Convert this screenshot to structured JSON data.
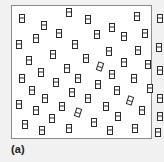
{
  "figure": {
    "panel_label": "(a)",
    "colors": {
      "outer_background": "#f1f1f1",
      "box_background": "#ffffff",
      "box_border": "#8a8a8a",
      "particle_outline": "#2b2b2b",
      "label_text": "#1a1a1a"
    },
    "container": {
      "x": 11,
      "y": 5,
      "width": 141,
      "height": 134
    },
    "particle": {
      "shape_name": "diatomic-molecule-icon",
      "width": 6,
      "height": 9,
      "description": "vertical rectangle divided by a horizontal line into two stacked units"
    },
    "particle_count": 56,
    "particles": [
      {
        "x": 10,
        "y": 12,
        "rot": 0
      },
      {
        "x": 57,
        "y": 6,
        "rot": 0
      },
      {
        "x": 32,
        "y": 19,
        "rot": 0
      },
      {
        "x": 76,
        "y": 13,
        "rot": 0
      },
      {
        "x": 100,
        "y": 21,
        "rot": 0
      },
      {
        "x": 125,
        "y": 10,
        "rot": 0
      },
      {
        "x": 148,
        "y": 12,
        "rot": 0
      },
      {
        "x": 47,
        "y": 27,
        "rot": 0
      },
      {
        "x": 85,
        "y": 28,
        "rot": 0
      },
      {
        "x": 112,
        "y": 30,
        "rot": 0
      },
      {
        "x": 133,
        "y": 27,
        "rot": 0
      },
      {
        "x": 7,
        "y": 38,
        "rot": 0
      },
      {
        "x": 24,
        "y": 32,
        "rot": 0
      },
      {
        "x": 63,
        "y": 38,
        "rot": 0
      },
      {
        "x": 97,
        "y": 45,
        "rot": 0
      },
      {
        "x": 126,
        "y": 44,
        "rot": 0
      },
      {
        "x": 147,
        "y": 41,
        "rot": 0
      },
      {
        "x": 41,
        "y": 48,
        "rot": 0
      },
      {
        "x": 17,
        "y": 54,
        "rot": 0
      },
      {
        "x": 74,
        "y": 52,
        "rot": 0
      },
      {
        "x": 112,
        "y": 56,
        "rot": 0
      },
      {
        "x": 136,
        "y": 58,
        "rot": 0
      },
      {
        "x": 55,
        "y": 62,
        "rot": 0
      },
      {
        "x": 88,
        "y": 60,
        "rot": 18
      },
      {
        "x": 29,
        "y": 66,
        "rot": 0
      },
      {
        "x": 100,
        "y": 68,
        "rot": 0
      },
      {
        "x": 148,
        "y": 64,
        "rot": 0
      },
      {
        "x": 10,
        "y": 72,
        "rot": 0
      },
      {
        "x": 66,
        "y": 72,
        "rot": 0
      },
      {
        "x": 122,
        "y": 72,
        "rot": 0
      },
      {
        "x": 44,
        "y": 76,
        "rot": 0
      },
      {
        "x": 86,
        "y": 78,
        "rot": 0
      },
      {
        "x": 20,
        "y": 84,
        "rot": 0
      },
      {
        "x": 60,
        "y": 86,
        "rot": 0
      },
      {
        "x": 105,
        "y": 84,
        "rot": 0
      },
      {
        "x": 138,
        "y": 82,
        "rot": 0
      },
      {
        "x": 33,
        "y": 92,
        "rot": 0
      },
      {
        "x": 76,
        "y": 92,
        "rot": 0
      },
      {
        "x": 118,
        "y": 94,
        "rot": 18
      },
      {
        "x": 148,
        "y": 92,
        "rot": 0
      },
      {
        "x": 7,
        "y": 98,
        "rot": 0
      },
      {
        "x": 50,
        "y": 100,
        "rot": 0
      },
      {
        "x": 94,
        "y": 100,
        "rot": 0
      },
      {
        "x": 24,
        "y": 104,
        "rot": 0
      },
      {
        "x": 66,
        "y": 106,
        "rot": 18
      },
      {
        "x": 130,
        "y": 104,
        "rot": 0
      },
      {
        "x": 106,
        "y": 110,
        "rot": 0
      },
      {
        "x": 148,
        "y": 110,
        "rot": 0
      },
      {
        "x": 40,
        "y": 112,
        "rot": 0
      },
      {
        "x": 13,
        "y": 118,
        "rot": 0
      },
      {
        "x": 82,
        "y": 116,
        "rot": 0
      },
      {
        "x": 57,
        "y": 122,
        "rot": 0
      },
      {
        "x": 30,
        "y": 124,
        "rot": 0
      },
      {
        "x": 98,
        "y": 124,
        "rot": 0
      },
      {
        "x": 123,
        "y": 122,
        "rot": 0
      },
      {
        "x": 146,
        "y": 126,
        "rot": 0
      }
    ]
  }
}
